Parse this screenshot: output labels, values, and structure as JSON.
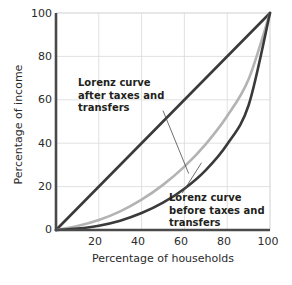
{
  "chart_data": {
    "type": "line",
    "title": "",
    "subtitle": "",
    "xlabel": "Percentage of households",
    "ylabel": "Percentage of income",
    "xlim": [
      0,
      100
    ],
    "ylim": [
      0,
      100
    ],
    "xticks": [
      20,
      40,
      60,
      80,
      100
    ],
    "yticks": [
      0,
      20,
      40,
      60,
      80,
      100
    ],
    "xtick_labels": [
      "20",
      "40",
      "60",
      "80",
      "100"
    ],
    "ytick_labels": [
      "0",
      "20",
      "40",
      "60",
      "80",
      "100"
    ],
    "grid": true,
    "legend": "none",
    "annotations": [
      {
        "id": "after-taxes",
        "text_lines": [
          "Lorenz curve",
          "after taxes and",
          "transfers"
        ],
        "text": "Lorenz curve after taxes and transfers",
        "points_to_series": "Lorenz curve after taxes and transfers",
        "leader_from": [
          50,
          55
        ],
        "leader_to": [
          62,
          26
        ]
      },
      {
        "id": "before-taxes",
        "text_lines": [
          "Lorenz curve",
          "before taxes and",
          "transfers"
        ],
        "text": "Lorenz curve before taxes and transfers",
        "points_to_series": "Lorenz curve before taxes and transfers",
        "leader_from": [
          59,
          17
        ],
        "leader_to": [
          68,
          31
        ]
      }
    ],
    "x": [
      0,
      10,
      20,
      30,
      40,
      50,
      60,
      70,
      80,
      90,
      100
    ],
    "series": [
      {
        "name": "Line of perfect equality",
        "color": "#3a3a3a",
        "width": 2.6,
        "values": [
          0,
          10,
          20,
          30,
          40,
          50,
          60,
          70,
          80,
          90,
          100
        ]
      },
      {
        "name": "Lorenz curve after taxes and transfers",
        "color": "#b3b3b3",
        "width": 2.6,
        "values": [
          0,
          1.8,
          4.6,
          8.6,
          14.0,
          20.8,
          29.2,
          39.6,
          52.5,
          69.5,
          100
        ]
      },
      {
        "name": "Lorenz curve before taxes and transfers",
        "color": "#3a3a3a",
        "width": 2.6,
        "values": [
          0,
          0.7,
          2.0,
          4.3,
          7.8,
          12.6,
          19.0,
          27.6,
          39.5,
          57.5,
          100
        ]
      }
    ]
  },
  "axes": {
    "x_title": "Percentage of households",
    "y_title": "Percentage of income",
    "x_ticks": [
      {
        "label": "20"
      },
      {
        "label": "40"
      },
      {
        "label": "60"
      },
      {
        "label": "80"
      },
      {
        "label": "100"
      }
    ],
    "y_ticks": [
      {
        "label": "100"
      },
      {
        "label": "80"
      },
      {
        "label": "60"
      },
      {
        "label": "40"
      },
      {
        "label": "20"
      },
      {
        "label": "0"
      }
    ]
  },
  "annotation_after": {
    "line1": "Lorenz curve",
    "line2": "after taxes and",
    "line3": "transfers"
  },
  "annotation_before": {
    "line1": "Lorenz curve",
    "line2": "before taxes and",
    "line3": "transfers"
  },
  "colors": {
    "curve_dark": "#3a3a3a",
    "curve_gray": "#b3b3b3",
    "axis": "#4a4a4a",
    "grid": "#d9d9d9",
    "text": "#2b2b2b",
    "annotation_text": "#231f20",
    "background": "#ffffff"
  }
}
